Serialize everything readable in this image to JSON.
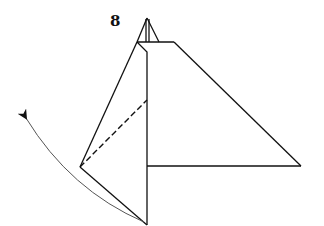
{
  "diagram": {
    "step_number": "8",
    "colors": {
      "line": "#111111",
      "arrow": "#555555",
      "background": "#ffffff"
    },
    "elements": {
      "fold_line": "dashed-valley-fold",
      "arrow": "curved-fold-arrow-up-left"
    }
  }
}
